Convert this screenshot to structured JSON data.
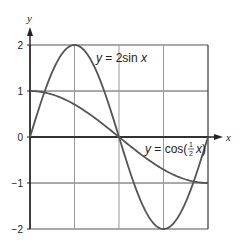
{
  "chart_data": {
    "type": "line",
    "title": "",
    "xlabel": "x",
    "ylabel": "y",
    "xlim": [
      0,
      6.2832
    ],
    "ylim": [
      -2,
      2
    ],
    "grid": true,
    "yticks": [
      "2",
      "1",
      "0",
      "−1",
      "−2"
    ],
    "ytick_values": [
      2,
      1,
      0,
      -1,
      -2
    ],
    "xgrid_values": [
      0,
      1.5708,
      3.1416,
      4.7124,
      6.2832
    ],
    "series": [
      {
        "name": "y = 2sin x",
        "label_parts": {
          "pre": "y",
          "mid": " = 2sin ",
          "post": "x"
        },
        "x": [
          0,
          0.7854,
          1.5708,
          2.3562,
          3.1416,
          3.927,
          4.7124,
          5.4978,
          6.2832
        ],
        "values": [
          0,
          1.41,
          2,
          1.41,
          0,
          -1.41,
          -2,
          -1.41,
          0
        ]
      },
      {
        "name": "y = cos(½ x)",
        "label_parts": {
          "pre": "y",
          "mid": " = cos(",
          "frac_num": "1",
          "frac_den": "2",
          "post": "x",
          "close": ")"
        },
        "x": [
          0,
          0.7854,
          1.5708,
          2.3562,
          3.1416,
          3.927,
          4.7124,
          5.4978,
          6.2832
        ],
        "values": [
          1,
          0.92,
          0.71,
          0.38,
          0,
          -0.38,
          -0.71,
          -0.92,
          -1
        ]
      }
    ],
    "legend": "inline labels"
  }
}
